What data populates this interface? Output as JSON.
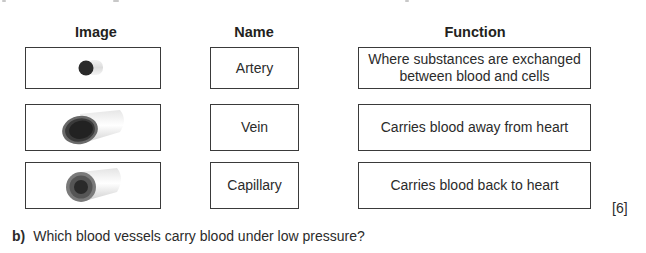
{
  "table": {
    "headers": {
      "image": "Image",
      "name": "Name",
      "function": "Function"
    },
    "images": [
      {
        "icon": "vessel-cross-section-small-icon",
        "description": "small dark vessel cross-section"
      },
      {
        "icon": "vessel-cross-section-thin-wall-icon",
        "description": "wide vessel with thin wall"
      },
      {
        "icon": "vessel-cross-section-thick-wall-icon",
        "description": "vessel with thick wall and narrow lumen"
      }
    ],
    "names": [
      "Artery",
      "Vein",
      "Capillary"
    ],
    "functions": [
      {
        "line1": "Where substances are exchanged",
        "line2": "between blood and cells"
      },
      {
        "line1": "Carries blood away from heart",
        "line2": ""
      },
      {
        "line1": "Carries blood back to heart",
        "line2": ""
      }
    ]
  },
  "marks": "[6]",
  "question_b": {
    "label": "b)",
    "text": "Which blood vessels carry blood under low pressure?"
  }
}
